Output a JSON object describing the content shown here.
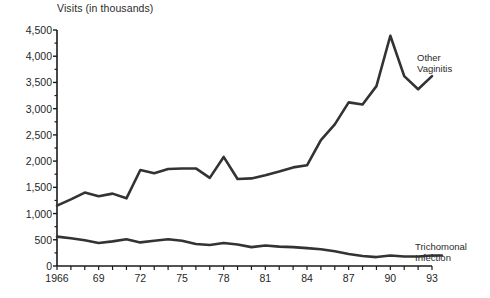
{
  "chart_data": {
    "type": "line",
    "title": "",
    "ylabel": "Visits (in thousands)",
    "xlabel": "",
    "ylim": [
      0,
      4500
    ],
    "ytick_values": [
      0,
      500,
      1000,
      1500,
      2000,
      2500,
      3000,
      3500,
      4000,
      4500
    ],
    "ytick_labels": [
      "0",
      "500",
      "1,000",
      "1,500",
      "2,000",
      "2,500",
      "3,000",
      "3,500",
      "4,000",
      "4,500"
    ],
    "xlim": [
      1966,
      1993
    ],
    "x": [
      1966,
      1967,
      1968,
      1969,
      1970,
      1971,
      1972,
      1973,
      1974,
      1975,
      1976,
      1977,
      1978,
      1979,
      1980,
      1981,
      1982,
      1983,
      1984,
      1985,
      1986,
      1987,
      1988,
      1989,
      1990,
      1991,
      1992,
      1993
    ],
    "xtick_labels": [
      "1966",
      "69",
      "72",
      "75",
      "78",
      "81",
      "84",
      "87",
      "90",
      "93"
    ],
    "xtick_values": [
      1966,
      1969,
      1972,
      1975,
      1978,
      1981,
      1984,
      1987,
      1990,
      1993
    ],
    "grid": false,
    "legend_position": "right-inline",
    "series": [
      {
        "name": "Other Vaginitis",
        "color": "#333333",
        "values": [
          1150,
          1270,
          1400,
          1330,
          1380,
          1290,
          1830,
          1770,
          1850,
          1860,
          1860,
          1680,
          2080,
          1660,
          1670,
          1730,
          1800,
          1880,
          1920,
          2400,
          2700,
          3120,
          3080,
          3430,
          4390,
          3620,
          3370,
          3620
        ]
      },
      {
        "name": "Trichomonal Infection",
        "color": "#333333",
        "values": [
          560,
          530,
          490,
          440,
          470,
          510,
          450,
          480,
          510,
          480,
          420,
          400,
          440,
          410,
          360,
          390,
          370,
          360,
          340,
          320,
          280,
          230,
          190,
          170,
          200,
          180,
          180,
          200
        ]
      }
    ],
    "annotations": [
      {
        "text": "Other Vaginitis",
        "at_x": 1993,
        "at_y": 3620
      },
      {
        "text": "Trichomonal Infection",
        "at_x": 1993,
        "at_y": 200
      }
    ]
  },
  "labels": {
    "series_other_vaginitis_line1": "Other",
    "series_other_vaginitis_line2": "Vaginitis",
    "series_trichomonal_line1": "Trichomonal",
    "series_trichomonal_line2": "Infection"
  },
  "colors": {
    "line": "#333333",
    "axis": "#1a1a1a",
    "background": "#ffffff",
    "text": "#1f1f1f"
  }
}
